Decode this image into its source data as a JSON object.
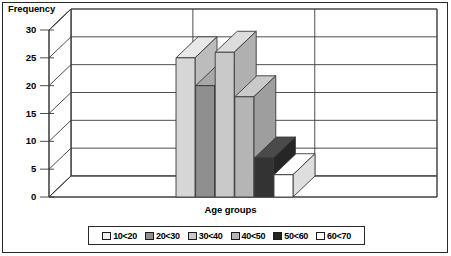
{
  "chart_data": {
    "type": "bar",
    "title": "",
    "subtitle": "",
    "xlabel": "Age groups",
    "ylabel": "Frequency",
    "categories": [
      "10<20",
      "20<30",
      "30<40",
      "40<50",
      "50<60",
      "60<70"
    ],
    "values": [
      25,
      20,
      26,
      18,
      7,
      4
    ],
    "series": [
      {
        "name": "Frequency",
        "values": [
          25,
          20,
          26,
          18,
          7,
          4
        ]
      }
    ],
    "ylim": [
      0,
      30
    ],
    "yticks": [
      0,
      5,
      10,
      15,
      20,
      25,
      30
    ],
    "ytick_labels": [
      "0",
      "5",
      "10",
      "15",
      "20",
      "25",
      "30"
    ],
    "grid": true,
    "grid_orientation": "horizontal",
    "legend_position": "bottom",
    "three_d": true,
    "bar_colors": [
      "#d6d6d6",
      "#8f8f8f",
      "#c9c9c9",
      "#b5b5b5",
      "#333333",
      "#ffffff"
    ],
    "bar_top_colors": [
      "#e8e8e8",
      "#a8a8a8",
      "#dcdcdc",
      "#cacaca",
      "#4a4a4a",
      "#ffffff"
    ],
    "bar_side_colors": [
      "#bcbcbc",
      "#7a7a7a",
      "#b0b0b0",
      "#9e9e9e",
      "#262626",
      "#dedede"
    ],
    "wall_color": "#ffffff",
    "floor_color": "#ffffff",
    "line_color": "#3a3a3a",
    "text_color": "#000000"
  },
  "chart": {
    "y_axis_title": "Frequency",
    "x_axis_title": "Age groups"
  },
  "legend": {
    "items": [
      {
        "label": "10<20",
        "color": "#efefef"
      },
      {
        "label": "20<30",
        "color": "#8f8f8f"
      },
      {
        "label": "30<40",
        "color": "#c9c9c9"
      },
      {
        "label": "40<50",
        "color": "#b5b5b5"
      },
      {
        "label": "50<60",
        "color": "#222222"
      },
      {
        "label": "60<70",
        "color": "#ffffff"
      }
    ]
  }
}
